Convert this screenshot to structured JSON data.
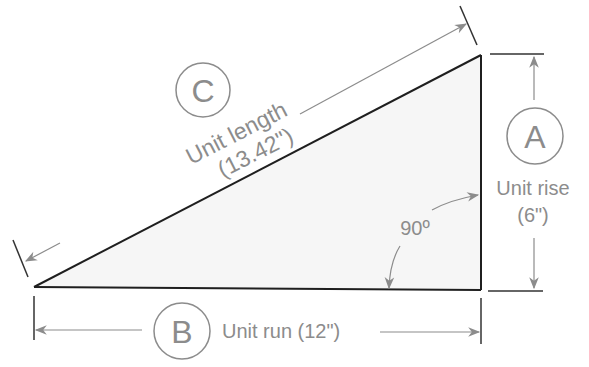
{
  "diagram": {
    "colors": {
      "triangle_stroke": "#1f1f1f",
      "triangle_fill": "#f6f6f6",
      "annotation": "#8c8c8c",
      "background": "#ffffff"
    },
    "labels": {
      "c_letter": "C",
      "c_text_line1": "Unit length",
      "c_text_line2": "(13.42\")",
      "a_letter": "A",
      "a_text_line1": "Unit rise",
      "a_text_line2": "(6\")",
      "b_letter": "B",
      "b_text": "Unit run (12\")",
      "angle": "90º"
    },
    "values": {
      "unit_length_in": 13.42,
      "unit_rise_in": 6,
      "unit_run_in": 12,
      "right_angle_deg": 90
    }
  }
}
